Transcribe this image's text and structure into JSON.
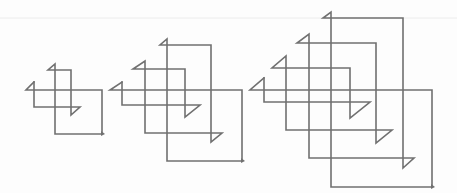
{
  "diagram": {
    "stroke_color": "#707070",
    "stroke_width": 1.6,
    "artifact_line": {
      "y": 18,
      "color": "#ececec"
    },
    "figures": [
      {
        "name": "spiral-order-2",
        "points": [
          [
            34,
            82
          ],
          [
            26,
            90
          ],
          [
            102,
            90
          ],
          [
            102,
            134
          ]
        ],
        "inner": [
          [
            34,
            82
          ],
          [
            34,
            107
          ],
          [
            80,
            107
          ],
          [
            71,
            115
          ],
          [
            71,
            70
          ],
          [
            48,
            70
          ],
          [
            55,
            64
          ],
          [
            55,
            134
          ],
          [
            102,
            134
          ]
        ],
        "arrow": [
          102,
          134
        ]
      },
      {
        "name": "spiral-order-3",
        "points": [
          [
            122,
            82
          ],
          [
            110,
            90
          ],
          [
            242,
            90
          ],
          [
            242,
            161
          ]
        ],
        "inner": [
          [
            122,
            82
          ],
          [
            122,
            105
          ],
          [
            200,
            105
          ],
          [
            185,
            117
          ],
          [
            185,
            69
          ],
          [
            133,
            69
          ],
          [
            145,
            61
          ],
          [
            145,
            133
          ],
          [
            222,
            133
          ],
          [
            211,
            142
          ],
          [
            211,
            45
          ],
          [
            160,
            45
          ],
          [
            167,
            39
          ],
          [
            167,
            161
          ],
          [
            242,
            161
          ]
        ],
        "arrow": [
          242,
          161
        ]
      },
      {
        "name": "spiral-order-4",
        "points": [
          [
            264,
            78
          ],
          [
            250,
            90
          ],
          [
            432,
            90
          ],
          [
            432,
            187
          ]
        ],
        "inner": [
          [
            264,
            78
          ],
          [
            264,
            102
          ],
          [
            370,
            102
          ],
          [
            350,
            118
          ],
          [
            350,
            68
          ],
          [
            272,
            68
          ],
          [
            286,
            56
          ],
          [
            286,
            130
          ],
          [
            392,
            130
          ],
          [
            376,
            143
          ],
          [
            376,
            43
          ],
          [
            297,
            43
          ],
          [
            309,
            34
          ],
          [
            309,
            158
          ],
          [
            414,
            158
          ],
          [
            403,
            168
          ],
          [
            403,
            18
          ],
          [
            323,
            18
          ],
          [
            331,
            12
          ],
          [
            331,
            187
          ],
          [
            432,
            187
          ]
        ],
        "arrow": [
          432,
          187
        ]
      }
    ]
  }
}
